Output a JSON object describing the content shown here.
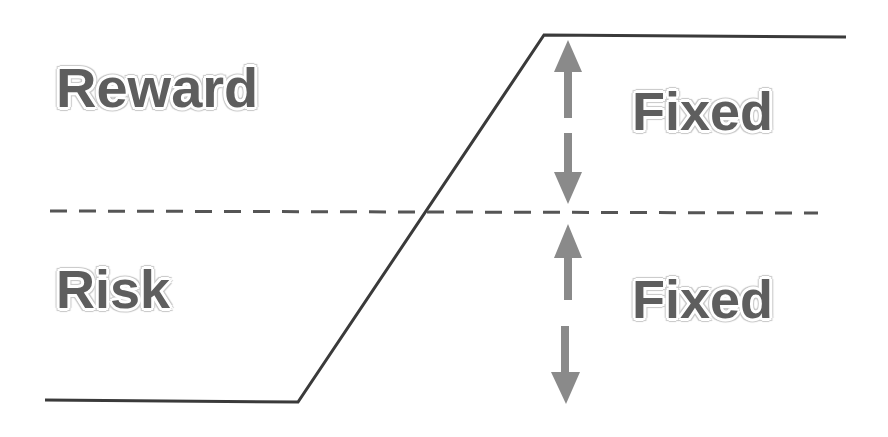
{
  "diagram": {
    "labels": {
      "reward": "Reward",
      "risk": "Risk",
      "fixed_top": "Fixed",
      "fixed_bottom": "Fixed"
    },
    "colors": {
      "line": "#3a3a3a",
      "dash": "#555555",
      "arrow": "#8a8a8a",
      "text": "#5e5e5e"
    },
    "elements": {
      "payoff_line": "payoff curve: flat low, rising, flat high",
      "breakeven_line": "dashed horizontal line",
      "arrows": [
        "up-arrow-top",
        "down-arrow-top",
        "up-arrow-bottom",
        "down-arrow-bottom"
      ]
    }
  }
}
